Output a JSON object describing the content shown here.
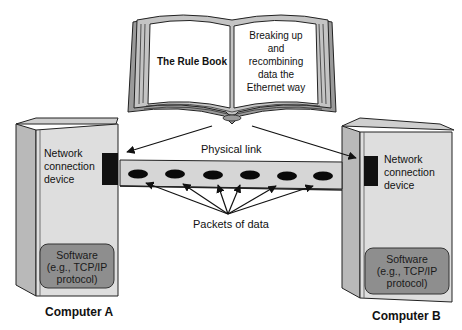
{
  "book": {
    "left_page": "The Rule Book",
    "right_page_lines": [
      "Breaking up",
      "and",
      "recombining",
      "data the",
      "Ethernet way"
    ]
  },
  "link": {
    "label": "Physical link",
    "packets_label": "Packets of data",
    "packet_count": 6
  },
  "computer_a": {
    "name": "Computer A",
    "device_lines": [
      "Network",
      "connection",
      "device"
    ],
    "software_lines": [
      "Software",
      "(e.g., TCP/IP",
      "protocol)"
    ]
  },
  "computer_b": {
    "name": "Computer B",
    "device_lines": [
      "Network",
      "connection",
      "device"
    ],
    "software_lines": [
      "Software",
      "(e.g., TCP/IP",
      "protocol)"
    ]
  },
  "colors": {
    "case_front": "#dedede",
    "case_side": "#b9b9b9",
    "case_top": "#cfcfcf",
    "software_box": "#8e8e8e",
    "cable": "#d6d6d6",
    "packet": "#0a0a0a",
    "nic": "#111111",
    "book_page": "#ffffff",
    "book_edge": "#bdbdbd"
  }
}
